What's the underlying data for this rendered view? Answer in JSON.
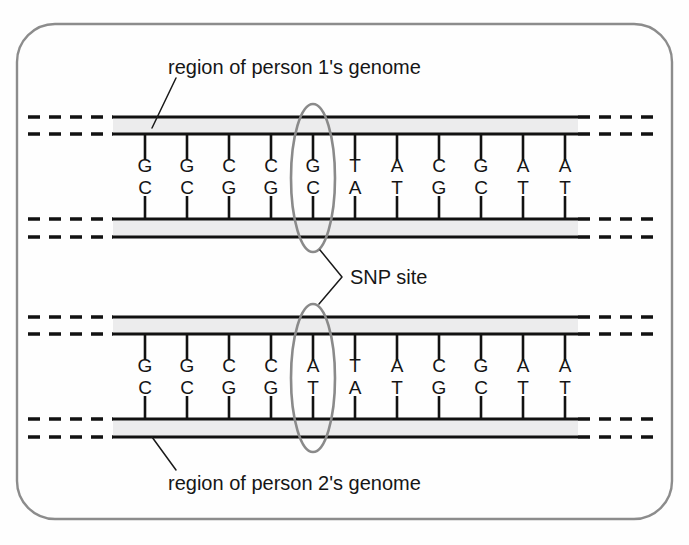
{
  "figure": {
    "type": "diagram",
    "frame_color": "#8c8c8c",
    "background_color": "#fefefe",
    "strand_color": "#111111",
    "band_fill_color": "#ececed",
    "ellipse_color": "#8a8a8a"
  },
  "labels": {
    "person1_caption": "region of person 1's genome",
    "person2_caption": "region of person 2's genome",
    "snp_caption": "SNP site"
  },
  "sequences": {
    "person1": {
      "top_strand": [
        "G",
        "G",
        "C",
        "C",
        "G",
        "T",
        "A",
        "C",
        "G",
        "A",
        "A"
      ],
      "bottom_strand": [
        "C",
        "C",
        "G",
        "G",
        "C",
        "A",
        "T",
        "G",
        "C",
        "T",
        "T"
      ],
      "snp_index": 4,
      "snp_top_base": "G",
      "snp_bottom_base": "C"
    },
    "person2": {
      "top_strand": [
        "G",
        "G",
        "C",
        "C",
        "A",
        "T",
        "A",
        "C",
        "G",
        "A",
        "A"
      ],
      "bottom_strand": [
        "C",
        "C",
        "G",
        "G",
        "T",
        "A",
        "T",
        "G",
        "C",
        "T",
        "T"
      ],
      "snp_index": 4,
      "snp_top_base": "A",
      "snp_bottom_base": "T"
    }
  },
  "geometry": {
    "base_count": 11,
    "first_base_x": 145,
    "base_spacing": 42,
    "person1": {
      "top_line_upper_y": 117,
      "top_line_lower_y": 134,
      "bottom_line_upper_y": 219,
      "bottom_line_lower_y": 237,
      "top_letter_y": 172,
      "bottom_letter_y": 194
    },
    "person2": {
      "top_line_upper_y": 317,
      "top_line_lower_y": 334,
      "bottom_line_upper_y": 419,
      "bottom_line_lower_y": 437,
      "top_letter_y": 372,
      "bottom_letter_y": 394
    },
    "solid_x_start": 113,
    "solid_x_end": 578,
    "dash_left_start": 28,
    "dash_left_end": 113,
    "dash_right_start": 578,
    "dash_right_end": 662,
    "ellipse_cx": 313,
    "ellipse_rx": 22,
    "ellipse_ry": 74
  }
}
